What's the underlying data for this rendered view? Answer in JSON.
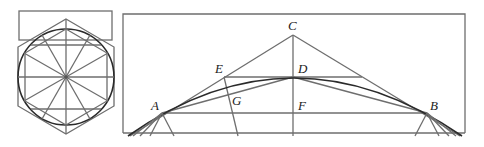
{
  "figure": {
    "left_panel": {
      "description": "hexagon with inscribed circle, radial lines, and rectangle on top"
    },
    "right_panel": {
      "labels": {
        "A": "A",
        "B": "B",
        "C": "C",
        "D": "D",
        "E": "E",
        "F": "F",
        "G": "G"
      }
    }
  }
}
